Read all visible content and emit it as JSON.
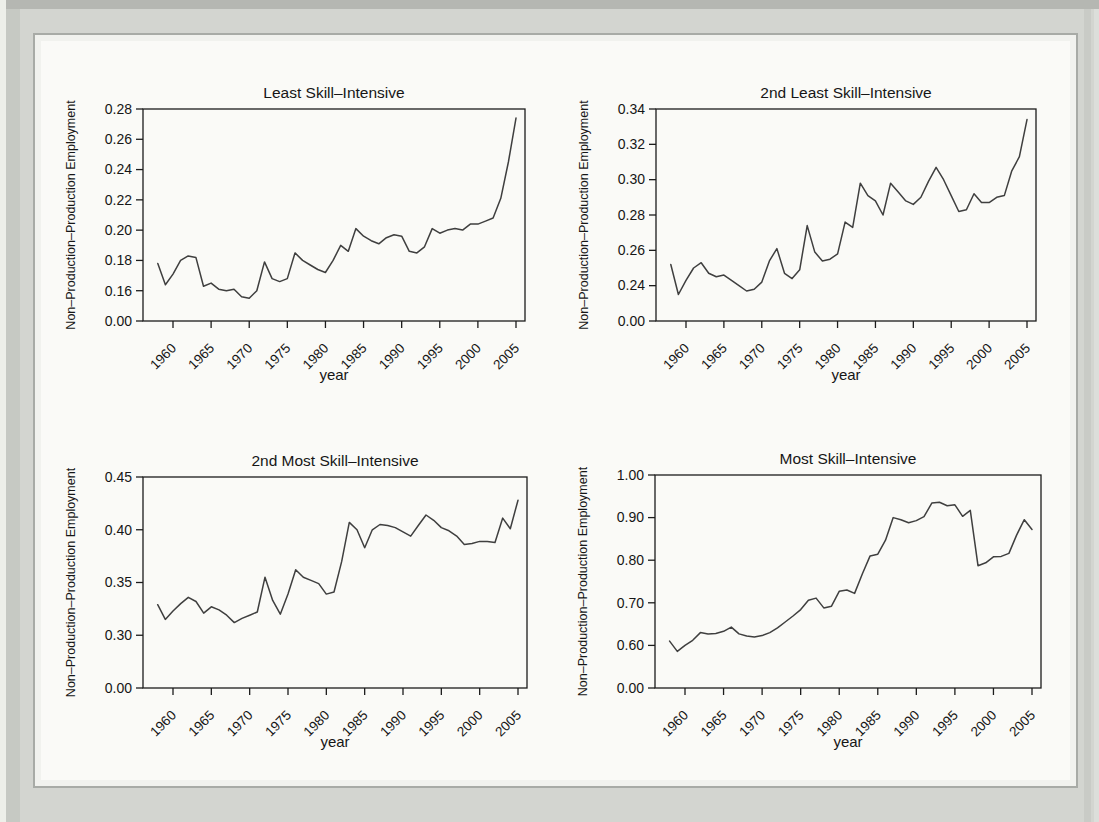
{
  "figure": {
    "kind": "2x2 small multiples of annual line plots",
    "x_axis_label": "year",
    "y_axis_label": "Non–Production–Production Employment"
  },
  "colors": {
    "page_bg": "#d3d5d0",
    "panel_bg": "#fafaf7",
    "panel_border": "#a8aba6",
    "frame": "#1c1c1c",
    "line": "#3f3f3f",
    "text": "#161616"
  },
  "chart_data": [
    {
      "type": "line",
      "title": "Least Skill–Intensive",
      "xlabel": "year",
      "ylabel": "Non–Production–Production Employment",
      "x_start": 1958,
      "x_ticks": [
        1960,
        1965,
        1970,
        1975,
        1980,
        1985,
        1990,
        1995,
        2000,
        2005
      ],
      "y_ticks": [
        0.28,
        0.26,
        0.24,
        0.22,
        0.2,
        0.18,
        0.16
      ],
      "y_zero_label": "0.00",
      "y_decimals": 2,
      "grid": false,
      "values": [
        0.178,
        0.164,
        0.171,
        0.18,
        0.183,
        0.182,
        0.163,
        0.165,
        0.161,
        0.16,
        0.161,
        0.156,
        0.155,
        0.16,
        0.179,
        0.168,
        0.166,
        0.168,
        0.185,
        0.18,
        0.177,
        0.174,
        0.172,
        0.18,
        0.19,
        0.186,
        0.201,
        0.196,
        0.193,
        0.191,
        0.195,
        0.197,
        0.196,
        0.186,
        0.185,
        0.189,
        0.201,
        0.198,
        0.2,
        0.201,
        0.2,
        0.204,
        0.204,
        0.206,
        0.208,
        0.221,
        0.245,
        0.274
      ]
    },
    {
      "type": "line",
      "title": "2nd Least Skill–Intensive",
      "xlabel": "year",
      "ylabel": "Non–Production–Production Employment",
      "x_start": 1958,
      "x_ticks": [
        1960,
        1965,
        1970,
        1975,
        1980,
        1985,
        1990,
        1995,
        2000,
        2005
      ],
      "y_ticks": [
        0.34,
        0.32,
        0.3,
        0.28,
        0.26,
        0.24
      ],
      "y_zero_label": "0.00",
      "y_decimals": 2,
      "grid": false,
      "values": [
        0.252,
        0.235,
        0.243,
        0.25,
        0.253,
        0.247,
        0.245,
        0.246,
        0.243,
        0.24,
        0.237,
        0.238,
        0.242,
        0.254,
        0.261,
        0.247,
        0.244,
        0.249,
        0.274,
        0.259,
        0.254,
        0.255,
        0.258,
        0.276,
        0.273,
        0.298,
        0.291,
        0.288,
        0.28,
        0.298,
        0.293,
        0.288,
        0.286,
        0.29,
        0.299,
        0.307,
        0.3,
        0.291,
        0.282,
        0.283,
        0.292,
        0.287,
        0.287,
        0.29,
        0.291,
        0.305,
        0.313,
        0.334
      ]
    },
    {
      "type": "line",
      "title": "2nd Most Skill–Intensive",
      "xlabel": "year",
      "ylabel": "Non–Production–Production Employment",
      "x_start": 1958,
      "x_ticks": [
        1960,
        1965,
        1970,
        1975,
        1980,
        1985,
        1990,
        1995,
        2000,
        2005
      ],
      "y_ticks": [
        0.45,
        0.4,
        0.35,
        0.3
      ],
      "y_zero_label": "0.00",
      "y_decimals": 2,
      "grid": false,
      "values": [
        0.329,
        0.315,
        0.323,
        0.33,
        0.336,
        0.332,
        0.321,
        0.327,
        0.324,
        0.319,
        0.312,
        0.316,
        0.319,
        0.322,
        0.355,
        0.333,
        0.32,
        0.339,
        0.362,
        0.355,
        0.352,
        0.349,
        0.339,
        0.341,
        0.37,
        0.407,
        0.4,
        0.383,
        0.4,
        0.405,
        0.404,
        0.402,
        0.398,
        0.394,
        0.404,
        0.414,
        0.409,
        0.402,
        0.399,
        0.394,
        0.386,
        0.387,
        0.389,
        0.389,
        0.388,
        0.411,
        0.401,
        0.428
      ]
    },
    {
      "type": "line",
      "title": "Most Skill–Intensive",
      "xlabel": "year",
      "ylabel": "Non–Production–Production Employment",
      "x_start": 1958,
      "x_ticks": [
        1960,
        1965,
        1970,
        1975,
        1980,
        1985,
        1990,
        1995,
        2000,
        2005
      ],
      "y_ticks": [
        1.0,
        0.9,
        0.8,
        0.7,
        0.6
      ],
      "y_zero_label": "0.00",
      "y_decimals": 2,
      "grid": false,
      "values": [
        0.61,
        0.586,
        0.6,
        0.612,
        0.63,
        0.627,
        0.628,
        0.633,
        0.643,
        0.627,
        0.622,
        0.62,
        0.623,
        0.63,
        0.641,
        0.655,
        0.669,
        0.684,
        0.706,
        0.711,
        0.688,
        0.692,
        0.727,
        0.73,
        0.722,
        0.768,
        0.81,
        0.814,
        0.847,
        0.9,
        0.895,
        0.888,
        0.893,
        0.902,
        0.934,
        0.936,
        0.928,
        0.93,
        0.903,
        0.917,
        0.787,
        0.794,
        0.808,
        0.809,
        0.816,
        0.859,
        0.895,
        0.872
      ]
    }
  ]
}
